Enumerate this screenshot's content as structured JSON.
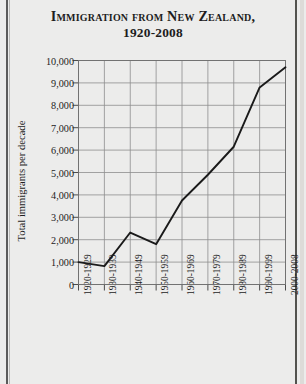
{
  "title": {
    "line1": "Immigration from New Zealand,",
    "line2": "1920-2008"
  },
  "chart_data": {
    "type": "line",
    "title": "Immigration from New Zealand, 1920-2008",
    "xlabel": "",
    "ylabel": "Total immigrants per decade",
    "categories": [
      "1920-1929",
      "1930-1939",
      "1940-1949",
      "1950-1959",
      "1960-1969",
      "1970-1979",
      "1980-1989",
      "1990-1999",
      "2000-2008"
    ],
    "values": [
      1000,
      820,
      2320,
      1800,
      3750,
      4900,
      6150,
      8800,
      9700
    ],
    "ylim": [
      0,
      10000
    ],
    "yticks": [
      0,
      1000,
      2000,
      3000,
      4000,
      5000,
      6000,
      7000,
      8000,
      9000,
      10000
    ],
    "ytick_labels": [
      "0",
      "1,000",
      "2,000",
      "3,000",
      "4,000",
      "5,000",
      "6,000",
      "7,000",
      "8,000",
      "9,000",
      "10,000"
    ],
    "grid": true,
    "legend": null,
    "line_color": "#1a1a1a",
    "grid_color": "#8e8e8e"
  }
}
